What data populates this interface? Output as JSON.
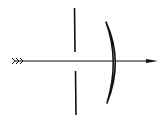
{
  "diagram": {
    "description": "Optical ray passing through an aperture stop and a meniscus lens",
    "colors": {
      "background": "#ffffff",
      "ink": "#111111"
    },
    "elements": {
      "ray": {
        "label": "incident light ray",
        "direction": "left-to-right"
      },
      "stop": {
        "label": "aperture stop"
      },
      "lens": {
        "label": "meniscus lens"
      }
    }
  }
}
